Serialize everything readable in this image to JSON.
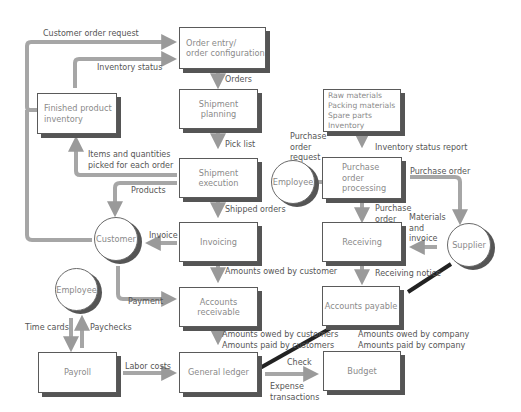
{
  "diagram": {
    "type": "order-to-cash and procure-to-pay process flow",
    "colors": {
      "arrow": "#9a9a9a",
      "dark_arrow": "#222222",
      "box_border": "#5a5a5a",
      "shadow": "#555555",
      "text": "#8a8a8a",
      "label": "#555555"
    }
  },
  "nodes": {
    "order_entry": "Order entry/\norder configuration",
    "finished_inventory": "Finished product\ninventory",
    "shipment_planning": "Shipment planning",
    "shipment_execution": "Shipment execution",
    "invoicing": "Invoicing",
    "accounts_receivable": "Accounts\nreceivable",
    "general_ledger": "General ledger",
    "payroll": "Payroll",
    "materials": "Raw materials\nPacking materials\nSpare parts\nInventory",
    "purchase_processing": "Purchase\norder\nprocessing",
    "receiving": "Receiving",
    "accounts_payable": "Accounts payable",
    "budget": "Budget"
  },
  "actors": {
    "customer": "Customer",
    "employee_top": "Employee",
    "employee_bottom": "Employee",
    "supplier": "Supplier"
  },
  "edges": {
    "customer_order_request": "Customer order request",
    "inventory_status": "Inventory status",
    "orders": "Orders",
    "pick_list": "Pick list",
    "items_picked": "Items and quantities\npicked for each order",
    "products": "Products",
    "shipped_orders": "Shipped orders",
    "invoice": "Invoice",
    "amounts_owed_by_customer": "Amounts owed by customer",
    "payment": "Payment",
    "ar_to_gl": "Amounts owed by customers\nAmounts paid by customers",
    "time_cards": "Time cards",
    "paychecks": "Paychecks",
    "labor_costs": "Labor costs",
    "check": "Check",
    "expense_transactions": "Expense\ntransactions",
    "inventory_status_report": "Inventory status report",
    "purchase_order_request": "Purchase\norder\nrequest",
    "purchase_order_to_supplier": "Purchase order",
    "purchase_order_to_receiving": "Purchase\norder",
    "materials_and_invoice": "Materials\nand\ninvoice",
    "receiving_notice": "Receiving notice",
    "ap_to_budget": "Amounts owed by company\nAmounts paid by company"
  }
}
